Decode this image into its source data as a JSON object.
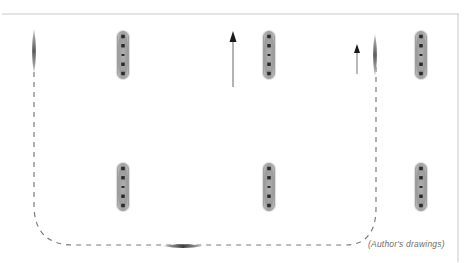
{
  "figure": {
    "kind": "nautical-formation-diagram",
    "width": 473,
    "height": 263,
    "background_color": "#ffffff",
    "caption": {
      "text": "(Author's drawings)",
      "x": 368,
      "y": 239,
      "color": "#6e6e6e",
      "style": "italic"
    },
    "frame": {
      "name": "page-border",
      "color": "#c9c9c9",
      "stroke_width": 1,
      "top_line": {
        "x1": 2,
        "y1": 14,
        "x2": 459,
        "y2": 14
      },
      "right_line": {
        "x1": 458,
        "y1": 14,
        "x2": 458,
        "y2": 262
      }
    },
    "track_line": {
      "name": "dashed-track-path",
      "color": "#7d7d7d",
      "stroke_width": 1.2,
      "dash_pattern": "5 5",
      "path": "M 34 72 L 34 205 Q 34 245 74 245 L 345 245 Q 376 245 376 208 L 376 62"
    },
    "arrows": [
      {
        "name": "heading-arrow-center",
        "x": 233,
        "tail_y": 87,
        "head_y": 31,
        "color": "#8a8a8a",
        "head_color": "#1a1a1a",
        "head_width": 7,
        "head_height": 11,
        "stroke_width": 1.3
      },
      {
        "name": "heading-arrow-right",
        "x": 357,
        "tail_y": 74,
        "head_y": 44,
        "color": "#8a8a8a",
        "head_color": "#1a1a1a",
        "head_width": 6,
        "head_height": 9,
        "stroke_width": 1.2
      }
    ],
    "ships": [
      {
        "name": "ship-beam-top-left",
        "type": "beam-on",
        "orientation": "vertical",
        "cx": 123,
        "cy": 55,
        "length": 47,
        "width": 11,
        "hull_color": "#9b9b9b",
        "mark_color": "#2b2b2b",
        "mark_count": 5
      },
      {
        "name": "ship-beam-top-center",
        "type": "beam-on",
        "orientation": "vertical",
        "cx": 269,
        "cy": 55,
        "length": 47,
        "width": 11,
        "hull_color": "#9b9b9b",
        "mark_color": "#2b2b2b",
        "mark_count": 5
      },
      {
        "name": "ship-beam-top-right",
        "type": "beam-on",
        "orientation": "vertical",
        "cx": 421,
        "cy": 55,
        "length": 47,
        "width": 11,
        "hull_color": "#9b9b9b",
        "mark_color": "#2b2b2b",
        "mark_count": 5
      },
      {
        "name": "ship-beam-bottom-left",
        "type": "beam-on",
        "orientation": "vertical",
        "cx": 123,
        "cy": 187,
        "length": 47,
        "width": 11,
        "hull_color": "#9b9b9b",
        "mark_color": "#2b2b2b",
        "mark_count": 5
      },
      {
        "name": "ship-beam-bottom-center",
        "type": "beam-on",
        "orientation": "vertical",
        "cx": 269,
        "cy": 187,
        "length": 47,
        "width": 11,
        "hull_color": "#9b9b9b",
        "mark_color": "#2b2b2b",
        "mark_count": 5
      },
      {
        "name": "ship-beam-bottom-right",
        "type": "beam-on",
        "orientation": "vertical",
        "cx": 421,
        "cy": 187,
        "length": 47,
        "width": 11,
        "hull_color": "#9b9b9b",
        "mark_color": "#2b2b2b",
        "mark_count": 5
      },
      {
        "name": "ship-bow-on-left",
        "type": "bow-on",
        "orientation": "vertical",
        "cx": 34,
        "cy": 51,
        "length": 44,
        "width": 5,
        "hull_color": "#7a7a7a"
      },
      {
        "name": "ship-bow-on-right",
        "type": "bow-on",
        "orientation": "vertical",
        "cx": 375,
        "cy": 55,
        "length": 42,
        "width": 5,
        "hull_color": "#7a7a7a"
      },
      {
        "name": "ship-bow-on-bottom",
        "type": "bow-on",
        "orientation": "horizontal",
        "cx": 183,
        "cy": 246,
        "length": 40,
        "width": 5,
        "hull_color": "#5a5a5a"
      }
    ]
  }
}
